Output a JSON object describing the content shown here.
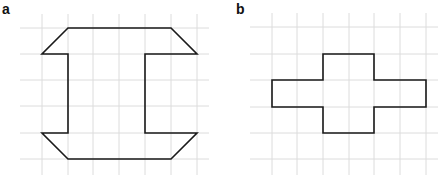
{
  "panels": [
    {
      "label": "a",
      "description": "Octagonal I-beam shaped outline on grid",
      "grid_x": [
        42,
        68,
        93,
        119,
        145,
        171,
        197
      ],
      "grid_y": [
        28,
        54,
        80,
        106,
        133,
        159
      ],
      "shape_points": "68,28 171,28 197,54 145,54 145,133 197,133 171,159 68,159 42,133 68,133 68,54 42,54"
    },
    {
      "label": "b",
      "description": "Cross/plus shaped outline on grid",
      "grid_x": [
        272,
        297,
        323,
        349,
        374,
        400,
        426
      ],
      "grid_y": [
        27,
        54,
        80,
        107,
        133,
        159
      ],
      "shape_points": "323,54 374,54 374,80 426,80 426,107 374,107 374,133 323,133 323,107 272,107 272,80 323,80"
    }
  ],
  "colors": {
    "grid": "#dcdcdc",
    "shape": "#1a1a1a"
  }
}
